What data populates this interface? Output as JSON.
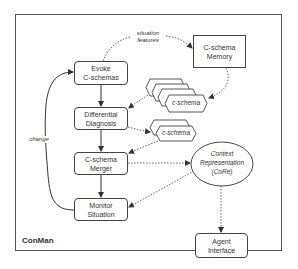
{
  "diagram": {
    "title": "ConMan",
    "nodes": {
      "evoke": {
        "line1": "Evoke",
        "line2": "C-schemas"
      },
      "differential": {
        "line1": "Differential",
        "line2": "Diagnosis"
      },
      "merger": {
        "line1": "C-schema",
        "line2": "Merger"
      },
      "monitor": {
        "line1": "Monitor",
        "line2": "Situation"
      },
      "memory": {
        "line1": "C-schema",
        "line2": "Memory"
      },
      "core": {
        "line1": "Context",
        "line2": "Representation",
        "line3": "(CoRe)"
      },
      "agent": {
        "line1": "Agent",
        "line2": "Interface"
      },
      "cschema_stack_1": {
        "label": "c-schema",
        "count": 4
      },
      "cschema_stack_2": {
        "label": "c-schema",
        "count": 2
      }
    },
    "edge_labels": {
      "situation_features_1": "situation",
      "situation_features_2": "features",
      "change": "change"
    },
    "edges": [
      {
        "from": "evoke",
        "to": "differential",
        "style": "solid"
      },
      {
        "from": "differential",
        "to": "merger",
        "style": "solid"
      },
      {
        "from": "merger",
        "to": "monitor",
        "style": "solid"
      },
      {
        "from": "monitor",
        "to": "evoke",
        "style": "solid",
        "label": "change"
      },
      {
        "from": "evoke",
        "to": "memory",
        "style": "dotted",
        "label": "situation features"
      },
      {
        "from": "memory",
        "to": "cschema_stack_1",
        "style": "dotted"
      },
      {
        "from": "cschema_stack_1",
        "to": "differential",
        "style": "dotted"
      },
      {
        "from": "differential",
        "to": "cschema_stack_2",
        "style": "dotted"
      },
      {
        "from": "cschema_stack_2",
        "to": "merger",
        "style": "dotted"
      },
      {
        "from": "merger",
        "to": "core",
        "style": "dotted"
      },
      {
        "from": "core",
        "to": "monitor",
        "style": "dotted"
      },
      {
        "from": "core",
        "to": "agent",
        "style": "dotted"
      }
    ]
  }
}
